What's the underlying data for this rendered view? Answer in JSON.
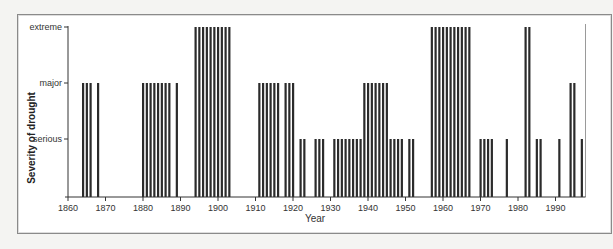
{
  "chart_data": {
    "type": "bar",
    "title": "",
    "xlabel": "Year",
    "ylabel": "Severity of drought",
    "xlim": [
      1860,
      1998
    ],
    "x_ticks": [
      1860,
      1870,
      1880,
      1890,
      1900,
      1910,
      1920,
      1930,
      1940,
      1950,
      1960,
      1970,
      1980,
      1990
    ],
    "y_levels": [
      "serious",
      "major",
      "extreme"
    ],
    "y_level_values": {
      "serious": 1,
      "major": 2,
      "extreme": 3
    },
    "grid": false,
    "legend": null,
    "bars": [
      {
        "year": 1864,
        "severity": "major"
      },
      {
        "year": 1865,
        "severity": "major"
      },
      {
        "year": 1866,
        "severity": "major"
      },
      {
        "year": 1868,
        "severity": "major"
      },
      {
        "year": 1880,
        "severity": "major"
      },
      {
        "year": 1881,
        "severity": "major"
      },
      {
        "year": 1882,
        "severity": "major"
      },
      {
        "year": 1883,
        "severity": "major"
      },
      {
        "year": 1884,
        "severity": "major"
      },
      {
        "year": 1885,
        "severity": "major"
      },
      {
        "year": 1886,
        "severity": "major"
      },
      {
        "year": 1887,
        "severity": "major"
      },
      {
        "year": 1889,
        "severity": "major"
      },
      {
        "year": 1894,
        "severity": "extreme"
      },
      {
        "year": 1895,
        "severity": "extreme"
      },
      {
        "year": 1896,
        "severity": "extreme"
      },
      {
        "year": 1897,
        "severity": "extreme"
      },
      {
        "year": 1898,
        "severity": "extreme"
      },
      {
        "year": 1899,
        "severity": "extreme"
      },
      {
        "year": 1900,
        "severity": "extreme"
      },
      {
        "year": 1901,
        "severity": "extreme"
      },
      {
        "year": 1902,
        "severity": "extreme"
      },
      {
        "year": 1903,
        "severity": "extreme"
      },
      {
        "year": 1911,
        "severity": "major"
      },
      {
        "year": 1912,
        "severity": "major"
      },
      {
        "year": 1913,
        "severity": "major"
      },
      {
        "year": 1914,
        "severity": "major"
      },
      {
        "year": 1915,
        "severity": "major"
      },
      {
        "year": 1916,
        "severity": "major"
      },
      {
        "year": 1918,
        "severity": "major"
      },
      {
        "year": 1919,
        "severity": "major"
      },
      {
        "year": 1920,
        "severity": "major"
      },
      {
        "year": 1922,
        "severity": "serious"
      },
      {
        "year": 1923,
        "severity": "serious"
      },
      {
        "year": 1926,
        "severity": "serious"
      },
      {
        "year": 1927,
        "severity": "serious"
      },
      {
        "year": 1928,
        "severity": "serious"
      },
      {
        "year": 1931,
        "severity": "serious"
      },
      {
        "year": 1932,
        "severity": "serious"
      },
      {
        "year": 1933,
        "severity": "serious"
      },
      {
        "year": 1934,
        "severity": "serious"
      },
      {
        "year": 1935,
        "severity": "serious"
      },
      {
        "year": 1936,
        "severity": "serious"
      },
      {
        "year": 1937,
        "severity": "serious"
      },
      {
        "year": 1938,
        "severity": "serious"
      },
      {
        "year": 1939,
        "severity": "major"
      },
      {
        "year": 1940,
        "severity": "major"
      },
      {
        "year": 1941,
        "severity": "major"
      },
      {
        "year": 1942,
        "severity": "major"
      },
      {
        "year": 1943,
        "severity": "major"
      },
      {
        "year": 1944,
        "severity": "major"
      },
      {
        "year": 1945,
        "severity": "major"
      },
      {
        "year": 1946,
        "severity": "serious"
      },
      {
        "year": 1947,
        "severity": "serious"
      },
      {
        "year": 1948,
        "severity": "serious"
      },
      {
        "year": 1949,
        "severity": "serious"
      },
      {
        "year": 1951,
        "severity": "serious"
      },
      {
        "year": 1952,
        "severity": "serious"
      },
      {
        "year": 1957,
        "severity": "extreme"
      },
      {
        "year": 1958,
        "severity": "extreme"
      },
      {
        "year": 1959,
        "severity": "extreme"
      },
      {
        "year": 1960,
        "severity": "extreme"
      },
      {
        "year": 1961,
        "severity": "extreme"
      },
      {
        "year": 1962,
        "severity": "extreme"
      },
      {
        "year": 1963,
        "severity": "extreme"
      },
      {
        "year": 1964,
        "severity": "extreme"
      },
      {
        "year": 1965,
        "severity": "extreme"
      },
      {
        "year": 1966,
        "severity": "extreme"
      },
      {
        "year": 1967,
        "severity": "extreme"
      },
      {
        "year": 1970,
        "severity": "serious"
      },
      {
        "year": 1971,
        "severity": "serious"
      },
      {
        "year": 1972,
        "severity": "serious"
      },
      {
        "year": 1973,
        "severity": "serious"
      },
      {
        "year": 1977,
        "severity": "serious"
      },
      {
        "year": 1982,
        "severity": "extreme"
      },
      {
        "year": 1983,
        "severity": "extreme"
      },
      {
        "year": 1985,
        "severity": "serious"
      },
      {
        "year": 1986,
        "severity": "serious"
      },
      {
        "year": 1991,
        "severity": "serious"
      },
      {
        "year": 1994,
        "severity": "major"
      },
      {
        "year": 1995,
        "severity": "major"
      },
      {
        "year": 1997,
        "severity": "serious"
      }
    ],
    "right_edge_marker_year": 1998
  },
  "colors": {
    "bar": "#2b2b2b",
    "axis": "#333333",
    "marker": "#9a9a9a"
  }
}
